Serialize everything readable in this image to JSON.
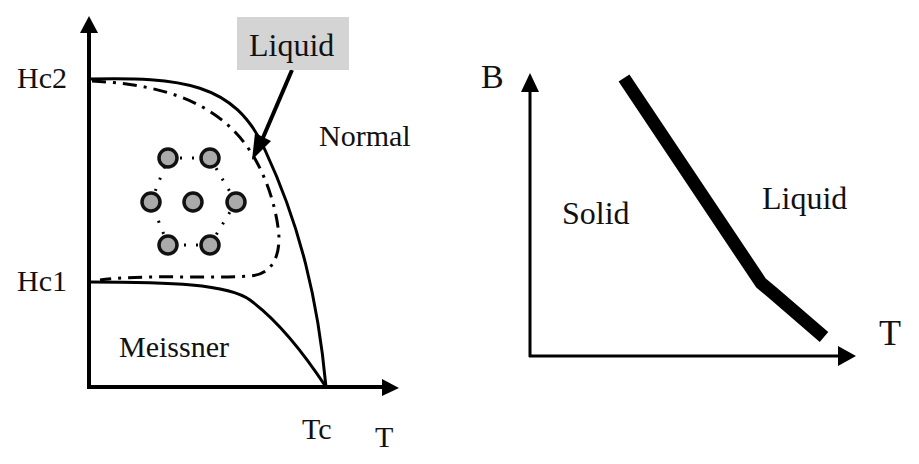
{
  "left_diagram": {
    "title": "Type-II superconductor H-T phase diagram",
    "y_ticks": {
      "hc2": "Hc2",
      "hc1": "Hc1"
    },
    "x_ticks": {
      "tc": "Tc"
    },
    "x_axis_label": "T",
    "regions": {
      "normal": "Normal",
      "meissner": "Meissner"
    },
    "callout": {
      "label": "Liquid",
      "box_color": "#d4d4d4"
    },
    "vortex_lattice": {
      "count": 7,
      "fill_color": "#aaaaaa"
    }
  },
  "right_diagram": {
    "title": "Vortex matter B-T phase diagram",
    "y_axis_label": "B",
    "x_axis_label": "T",
    "regions": {
      "solid": "Solid",
      "liquid": "Liquid"
    }
  }
}
